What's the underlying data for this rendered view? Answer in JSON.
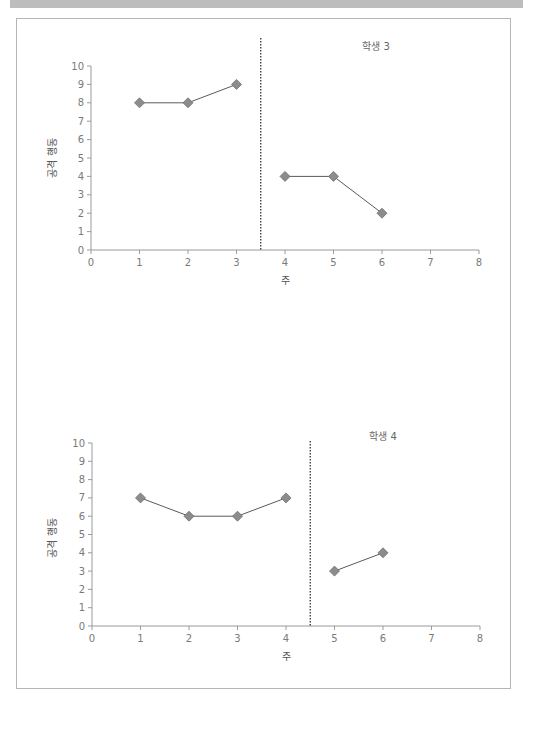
{
  "chart_data": [
    {
      "type": "line",
      "title": "학생 3",
      "xlabel": "주",
      "ylabel": "공격 행동",
      "xlim": [
        0,
        8
      ],
      "ylim": [
        0,
        10
      ],
      "xticks": [
        0,
        1,
        2,
        3,
        4,
        5,
        6,
        7,
        8
      ],
      "yticks": [
        0,
        1,
        2,
        3,
        4,
        5,
        6,
        7,
        8,
        9,
        10
      ],
      "grid": false,
      "phase_change_line_x": 3.5,
      "series": [
        {
          "name": "baseline",
          "x": [
            1,
            2,
            3
          ],
          "values": [
            8,
            8,
            9
          ]
        },
        {
          "name": "intervention",
          "x": [
            4,
            5,
            6
          ],
          "values": [
            4,
            4,
            2
          ]
        }
      ]
    },
    {
      "type": "line",
      "title": "학생 4",
      "xlabel": "주",
      "ylabel": "공격 행동",
      "xlim": [
        0,
        8
      ],
      "ylim": [
        0,
        10
      ],
      "xticks": [
        0,
        1,
        2,
        3,
        4,
        5,
        6,
        7,
        8
      ],
      "yticks": [
        0,
        1,
        2,
        3,
        4,
        5,
        6,
        7,
        8,
        9,
        10
      ],
      "grid": false,
      "phase_change_line_x": 4.5,
      "series": [
        {
          "name": "baseline",
          "x": [
            1,
            2,
            3,
            4
          ],
          "values": [
            7,
            6,
            6,
            7
          ]
        },
        {
          "name": "intervention",
          "x": [
            5,
            6
          ],
          "values": [
            3,
            4
          ]
        }
      ]
    }
  ],
  "colors": {
    "marker": "#8c8c8c",
    "marker_stroke": "#6e6e6e",
    "line": "#5a5a5a",
    "axis": "#9a9a9a",
    "phase_line": "#333333"
  }
}
